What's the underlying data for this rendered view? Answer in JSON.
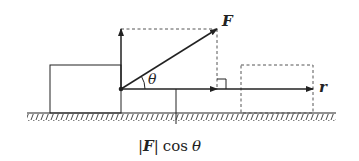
{
  "diagram": {
    "labels": {
      "force": "F",
      "displacement": "r",
      "angle": "θ",
      "projection_bar_left": "|",
      "projection_force": "F",
      "projection_bar_right": "|",
      "projection_cos": "cos",
      "projection_angle": "θ"
    },
    "colors": {
      "line": "#222222",
      "dashed": "#555555",
      "background": "#ffffff"
    }
  }
}
